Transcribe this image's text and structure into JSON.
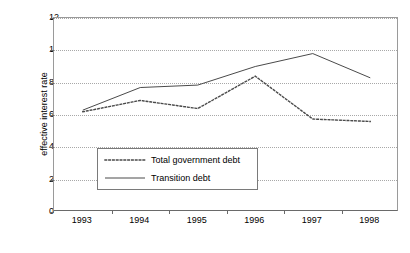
{
  "chart_data": {
    "type": "line",
    "title": "",
    "xlabel": "",
    "ylabel": "effective interest rate",
    "categories": [
      "1993",
      "1994",
      "1995",
      "1996",
      "1997",
      "1998"
    ],
    "x_tick_labels": [
      "1993",
      "1994",
      "1995",
      "1996",
      "1997",
      "1998"
    ],
    "y_tick_labels": [
      "0",
      "2",
      "4",
      "6",
      "8",
      "10",
      "12"
    ],
    "y_ticks": [
      0,
      2,
      4,
      6,
      8,
      10,
      12
    ],
    "ylim": [
      0,
      12
    ],
    "grid": "horizontal-dotted",
    "legend_position": "inside-lower-left",
    "series": [
      {
        "name": "Total government debt",
        "style": "dotted",
        "values": [
          6.2,
          6.9,
          6.4,
          8.4,
          5.75,
          5.6
        ]
      },
      {
        "name": "Transition debt",
        "style": "solid",
        "values": [
          6.3,
          7.7,
          7.85,
          9.0,
          9.8,
          8.3
        ]
      }
    ]
  },
  "legend": {
    "items": [
      {
        "label": "Total government debt",
        "style": "dotted"
      },
      {
        "label": "Transition debt",
        "style": "solid"
      }
    ]
  }
}
